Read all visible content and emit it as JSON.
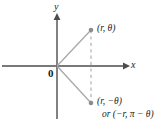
{
  "figure": {
    "type": "coordinate-plane-diagram",
    "colors": {
      "axis": "#4d4d4d",
      "ray": "#a0a0a0",
      "dashed": "#a0a0a0",
      "point": "#8c8c8c",
      "text": "#1a1a1a",
      "background": "#ffffff"
    },
    "axes": {
      "x_label": "x",
      "y_label": "y",
      "origin_label": "0",
      "x_axis": {
        "y": 66,
        "x_start": 2,
        "x_end": 129,
        "arrow": "right"
      },
      "y_axis": {
        "x": 57,
        "y_start": 14,
        "y_end": 119,
        "arrow": "up"
      }
    },
    "points": [
      {
        "name": "upper-point",
        "x": 91,
        "y": 30,
        "label": "(r, θ)",
        "label_parts": {
          "open": "(",
          "r": "r",
          "comma": ", ",
          "theta": "θ",
          "close": ")"
        }
      },
      {
        "name": "lower-point",
        "x": 91,
        "y": 103,
        "label": "(r, −θ)",
        "label_alt": "or (−r, π − θ)"
      }
    ],
    "rays": [
      {
        "name": "ray-to-upper-point",
        "from": [
          57,
          66
        ],
        "to": [
          91,
          30
        ]
      },
      {
        "name": "ray-to-lower-point",
        "from": [
          57,
          66
        ],
        "to": [
          91,
          103
        ]
      }
    ],
    "dashed_segment": {
      "name": "vertical-dashed-connector",
      "x": 91,
      "y_top": 30,
      "y_bottom": 103
    }
  }
}
